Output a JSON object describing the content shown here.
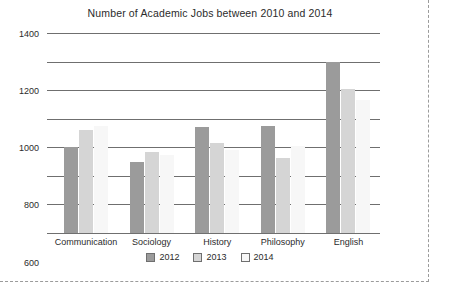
{
  "chart_data": {
    "type": "bar",
    "title": "Number of Academic Jobs between 2010 and 2014",
    "xlabel": "",
    "ylabel": "",
    "ylim": [
      0,
      1400
    ],
    "yticks": [
      0,
      200,
      400,
      600,
      800,
      1000,
      1200,
      1400
    ],
    "ytick_labels": [
      "0",
      "200",
      "400",
      "600",
      "800",
      "1000",
      "1200",
      "1400"
    ],
    "grid": true,
    "legend_position": "bottom",
    "categories": [
      "Communication",
      "Sociology",
      "History",
      "Philosophy",
      "English"
    ],
    "series": [
      {
        "name": "2012",
        "color": "#9b9b9b",
        "values": [
          600,
          500,
          745,
          750,
          1200
        ]
      },
      {
        "name": "2013",
        "color": "#d5d5d5",
        "values": [
          720,
          570,
          630,
          525,
          1010
        ]
      },
      {
        "name": "2014",
        "color": "#f7f7f7",
        "values": [
          750,
          545,
          580,
          610,
          930
        ]
      }
    ]
  }
}
